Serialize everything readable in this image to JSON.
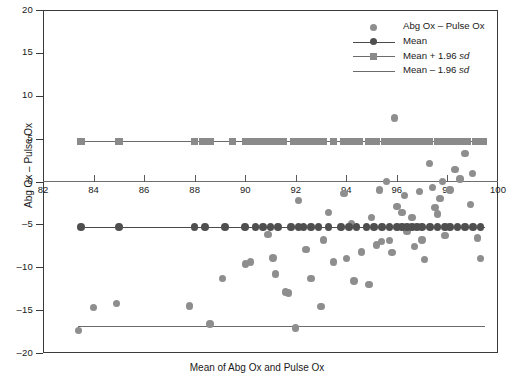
{
  "chart_data": {
    "type": "scatter",
    "title": "",
    "subtitle": "",
    "xlabel": "Mean of Abg Ox and Pulse Ox",
    "ylabel": "Abg Ox – Pulse Ox",
    "xlim": [
      82,
      100
    ],
    "ylim": [
      -20,
      20
    ],
    "xticks": [
      82,
      84,
      86,
      88,
      90,
      92,
      94,
      96,
      98,
      100
    ],
    "yticks": [
      20,
      15,
      10,
      5,
      0,
      -5,
      -10,
      -15,
      -20
    ],
    "grid": false,
    "legend_position": "top-right",
    "legend": [
      {
        "label": "Abg Ox – Pulse Ox",
        "marker": "circle",
        "color": "#8e8e8e",
        "line": false
      },
      {
        "label": "Mean",
        "marker": "circle",
        "color": "#4f4f4f",
        "line": true
      },
      {
        "label": "Mean + 1.96 sd",
        "label_plain": "Mean + 1.96 ",
        "label_italic": "sd",
        "marker": "square",
        "color": "#8a8a8a",
        "line": true
      },
      {
        "label": "Mean – 1.96 sd",
        "label_plain": "Mean – 1.96 ",
        "label_italic": "sd",
        "marker": "none",
        "color": "#6b6b6b",
        "line": true
      }
    ],
    "reference_lines": [
      {
        "name": "mean_plus_1.96sd",
        "value": 4.7,
        "x_start": 83.5,
        "x_end": 99.5,
        "style": "solid-with-square-markers"
      },
      {
        "name": "mean",
        "value": -5.3,
        "x_start": 83.5,
        "x_end": 99.5,
        "style": "solid-with-circle-markers"
      },
      {
        "name": "mean_minus_1.96sd",
        "value": -16.8,
        "x_start": 83.4,
        "x_end": 99.5,
        "style": "solid"
      }
    ],
    "series": [
      {
        "name": "Abg Ox – Pulse Ox",
        "color": "#8e8e8e",
        "points": [
          [
            83.4,
            -17.4
          ],
          [
            84.0,
            -14.7
          ],
          [
            84.9,
            -14.2
          ],
          [
            87.8,
            -14.5
          ],
          [
            88.6,
            -16.6
          ],
          [
            89.1,
            -11.3
          ],
          [
            90.0,
            -9.6
          ],
          [
            90.2,
            -9.4
          ],
          [
            90.9,
            -6.2
          ],
          [
            91.1,
            -8.9
          ],
          [
            91.2,
            -10.8
          ],
          [
            91.6,
            -12.9
          ],
          [
            91.7,
            -13.0
          ],
          [
            92.0,
            -17.1
          ],
          [
            92.1,
            -2.2
          ],
          [
            92.4,
            -7.9
          ],
          [
            92.6,
            -11.3
          ],
          [
            93.0,
            -14.6
          ],
          [
            93.1,
            -6.8
          ],
          [
            93.3,
            -3.6
          ],
          [
            93.5,
            -9.4
          ],
          [
            93.9,
            -1.4
          ],
          [
            94.0,
            -9.0
          ],
          [
            94.2,
            -4.9
          ],
          [
            94.3,
            -11.6
          ],
          [
            94.6,
            -8.2
          ],
          [
            94.9,
            -12.0
          ],
          [
            95.0,
            -4.2
          ],
          [
            95.2,
            -7.4
          ],
          [
            95.3,
            -1.0
          ],
          [
            95.4,
            -7.0
          ],
          [
            95.6,
            0.0
          ],
          [
            95.7,
            -6.9
          ],
          [
            95.8,
            -8.3
          ],
          [
            95.9,
            7.4
          ],
          [
            96.0,
            -2.9
          ],
          [
            96.2,
            -3.6
          ],
          [
            96.3,
            -1.6
          ],
          [
            96.4,
            -5.8
          ],
          [
            96.6,
            -4.2
          ],
          [
            96.7,
            -7.6
          ],
          [
            96.9,
            -1.2
          ],
          [
            97.0,
            -6.8
          ],
          [
            97.1,
            -9.1
          ],
          [
            97.3,
            2.1
          ],
          [
            97.4,
            -0.7
          ],
          [
            97.5,
            -3.0
          ],
          [
            97.6,
            -3.8
          ],
          [
            97.7,
            -2.0
          ],
          [
            97.8,
            0.0
          ],
          [
            97.9,
            -6.3
          ],
          [
            98.1,
            -1.0
          ],
          [
            98.3,
            1.4
          ],
          [
            98.5,
            0.3
          ],
          [
            98.7,
            3.3
          ],
          [
            98.9,
            -2.7
          ],
          [
            99.0,
            0.9
          ],
          [
            99.2,
            -6.6
          ],
          [
            99.3,
            -9.0
          ]
        ]
      },
      {
        "name": "Mean markers",
        "color": "#4f4f4f",
        "y": -5.3,
        "x_values": [
          83.5,
          85.0,
          88.0,
          88.4,
          89.2,
          90.0,
          90.4,
          90.7,
          91.0,
          91.3,
          91.8,
          92.1,
          92.3,
          92.6,
          92.9,
          93.3,
          93.8,
          94.1,
          94.4,
          94.8,
          95.1,
          95.4,
          95.7,
          96.0,
          96.2,
          96.4,
          96.6,
          96.8,
          97.0,
          97.3,
          97.6,
          97.9,
          98.1,
          98.4,
          98.7,
          99.0,
          99.3
        ]
      },
      {
        "name": "Mean + 1.96 sd markers",
        "color": "#8a8a8a",
        "y": 4.7,
        "x_values": [
          83.5,
          85.0,
          88.0,
          88.3,
          88.6,
          89.5,
          90.0,
          90.3,
          90.6,
          90.9,
          91.2,
          91.5,
          91.9,
          92.2,
          92.5,
          92.8,
          93.1,
          93.5,
          93.9,
          94.2,
          94.5,
          94.9,
          95.2,
          95.5,
          95.8,
          96.1,
          96.4,
          96.7,
          97.0,
          97.3,
          97.6,
          97.9,
          98.2,
          98.5,
          98.8,
          99.1,
          99.4
        ]
      }
    ]
  }
}
